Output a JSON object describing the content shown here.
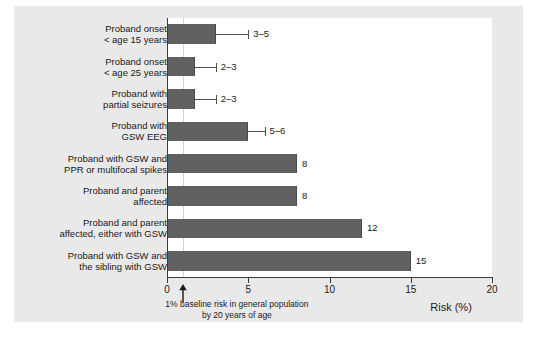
{
  "chart_data": {
    "type": "bar",
    "orientation": "horizontal",
    "title": "",
    "xlabel": "Risk (%)",
    "ylabel": "",
    "xlim": [
      0,
      20
    ],
    "xticks": [
      0,
      5,
      10,
      15,
      20
    ],
    "xtick_labels": [
      "0",
      "5",
      "10",
      "15",
      "20"
    ],
    "grid": false,
    "legend": "none",
    "bar_color": "#616161",
    "categories": [
      "Proband onset\n< age 15 years",
      "Proband onset\n< age 25 years",
      "Proband with\npartial seizures",
      "Proband with\nGSW EEG",
      "Proband with GSW and\nPPR or multifocal spikes",
      "Proband and parent\naffected",
      "Proband and parent\naffected, either with GSW",
      "Proband with GSW and\nthe sibling with GSW"
    ],
    "values": [
      3,
      1.7,
      1.7,
      5,
      8,
      8,
      12,
      15
    ],
    "value_labels": [
      "3–5",
      "2–3",
      "2–3",
      "5–6",
      "8",
      "8",
      "12",
      "15"
    ],
    "error_ranges": [
      [
        3,
        5
      ],
      [
        2,
        3
      ],
      [
        2,
        3
      ],
      [
        5,
        6
      ],
      null,
      null,
      null,
      null
    ],
    "annotations": [
      {
        "text_line1": "1% baseline risk in general population",
        "text_line2": "by 20 years of age",
        "at_x": 1,
        "marker": "up-arrow"
      }
    ],
    "reference_line": {
      "x": 1,
      "color": "#d2d2d2"
    }
  },
  "bars": [
    {
      "label_line1": "Proband onset",
      "label_line2": "< age 15 years",
      "value": 3,
      "value_label": "3–5",
      "err_low": 3,
      "err_high": 5
    },
    {
      "label_line1": "Proband onset",
      "label_line2": "< age 25 years",
      "value": 1.7,
      "value_label": "2–3",
      "err_low": 2,
      "err_high": 3
    },
    {
      "label_line1": "Proband with",
      "label_line2": "partial seizures",
      "value": 1.7,
      "value_label": "2–3",
      "err_low": 2,
      "err_high": 3
    },
    {
      "label_line1": "Proband with",
      "label_line2": "GSW EEG",
      "value": 5,
      "value_label": "5–6",
      "err_low": 5,
      "err_high": 6
    },
    {
      "label_line1": "Proband with GSW and",
      "label_line2": "PPR or multifocal spikes",
      "value": 8,
      "value_label": "8",
      "err_low": null,
      "err_high": null
    },
    {
      "label_line1": "Proband and parent",
      "label_line2": "affected",
      "value": 8,
      "value_label": "8",
      "err_low": null,
      "err_high": null
    },
    {
      "label_line1": "Proband and parent",
      "label_line2": "affected, either with GSW",
      "value": 12,
      "value_label": "12",
      "err_low": null,
      "err_high": null
    },
    {
      "label_line1": "Proband with GSW and",
      "label_line2": "the sibling with GSW",
      "value": 15,
      "value_label": "15",
      "err_low": null,
      "err_high": null
    }
  ],
  "axis": {
    "title": "Risk (%)",
    "ticks": [
      "0",
      "5",
      "10",
      "15",
      "20"
    ]
  },
  "annotation": {
    "line1": "1% baseline risk in general population",
    "line2": "by 20 years of age"
  }
}
